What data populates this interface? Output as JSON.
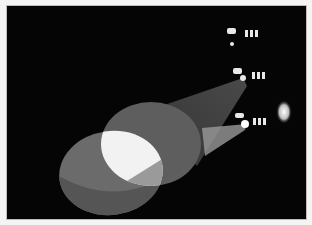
{
  "image": {
    "subject": "Stage spotlights projecting overlapping beams of light in darkness",
    "style": "black-and-white photograph",
    "colors": {
      "background": "#050505",
      "frame": "#f4f4f4",
      "beam": "#8a8a8a",
      "overlap": "#f5f5f5"
    },
    "elements": [
      {
        "name": "spotlight-top",
        "x": 232,
        "y": 28
      },
      {
        "name": "spotlight-middle",
        "x": 238,
        "y": 68
      },
      {
        "name": "spotlight-bottom",
        "x": 240,
        "y": 115
      },
      {
        "name": "flare",
        "x": 283,
        "y": 112
      },
      {
        "name": "beam-ellipse-left",
        "cx": 110,
        "cy": 172,
        "rx": 52,
        "ry": 42
      },
      {
        "name": "beam-ellipse-right",
        "cx": 150,
        "cy": 144,
        "rx": 48,
        "ry": 42
      }
    ]
  }
}
